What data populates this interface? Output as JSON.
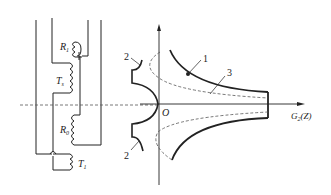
{
  "circuit": {
    "labels": {
      "r1": "R",
      "r1_sub": "1",
      "ts": "T",
      "ts_sub": "s",
      "r0": "R",
      "r0_sub": "0",
      "t1": "T",
      "t1_sub": "1"
    }
  },
  "plot": {
    "origin_label": "O",
    "x_axis_label": "G",
    "x_axis_sub": "2",
    "x_axis_suffix": "(Z)",
    "curve_labels": {
      "curve1": "1",
      "curve2_top": "2",
      "curve2_bottom": "2",
      "curve3": "3"
    }
  },
  "colors": {
    "line": "#222222",
    "dashed": "#555555"
  }
}
